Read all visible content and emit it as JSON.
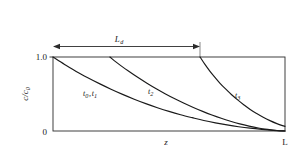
{
  "figure": {
    "caption_present": false,
    "background_color": "#ffffff",
    "line_color": "#1a1a1a"
  },
  "chart_data": {
    "type": "line",
    "title": "",
    "subtitle": "",
    "xlabel": "z",
    "ylabel": "c/c0",
    "ylabel_display": "c/c",
    "ylabel_sub": "0",
    "xlim": [
      0,
      1
    ],
    "ylim": [
      0,
      1
    ],
    "grid": false,
    "legend_position": "inline-annotations",
    "x_tick_labels": [
      "0",
      "L"
    ],
    "x_tick_values": [
      0,
      1
    ],
    "y_tick_labels": [
      "1.0"
    ],
    "y_tick_values": [
      1.0
    ],
    "axis_origin_label": "0",
    "annotations": [
      {
        "name": "depletion-length-arrow",
        "label": "L",
        "label_sub": "d",
        "type": "double-headed-arrow",
        "x_start": 0.0,
        "x_end": 0.634
      }
    ],
    "series": [
      {
        "name": "t0-t1",
        "label": "t",
        "label_sub": "0",
        "label_full": "t0 , t1",
        "label_parts": [
          "t",
          "0",
          ",",
          "t",
          "1"
        ],
        "front_position": 0.0,
        "x": [
          0.0,
          0.05,
          0.1,
          0.15,
          0.2,
          0.25,
          0.3,
          0.35,
          0.4,
          0.45,
          0.5,
          0.55,
          0.6,
          0.65,
          0.7,
          0.75,
          0.8,
          0.85,
          0.9,
          0.95,
          1.0
        ],
        "y": [
          1.0,
          0.9,
          0.805,
          0.72,
          0.64,
          0.565,
          0.495,
          0.43,
          0.37,
          0.315,
          0.265,
          0.22,
          0.18,
          0.142,
          0.11,
          0.082,
          0.058,
          0.038,
          0.022,
          0.009,
          0.0
        ]
      },
      {
        "name": "t2",
        "label": "t",
        "label_sub": "2",
        "label_full": "t2",
        "front_position": 0.245,
        "x": [
          0.245,
          0.285,
          0.325,
          0.365,
          0.405,
          0.445,
          0.485,
          0.525,
          0.565,
          0.605,
          0.645,
          0.685,
          0.725,
          0.765,
          0.805,
          0.845,
          0.885,
          0.925,
          0.965,
          1.0
        ],
        "y": [
          1.0,
          0.9,
          0.81,
          0.725,
          0.645,
          0.57,
          0.5,
          0.435,
          0.375,
          0.318,
          0.265,
          0.216,
          0.172,
          0.132,
          0.096,
          0.066,
          0.041,
          0.022,
          0.007,
          0.0
        ]
      },
      {
        "name": "t3",
        "label": "t",
        "label_sub": "3",
        "label_full": "t3",
        "front_position": 0.634,
        "x": [
          0.634,
          0.655,
          0.676,
          0.698,
          0.72,
          0.745,
          0.77,
          0.796,
          0.822,
          0.85,
          0.878,
          0.906,
          0.935,
          0.965,
          1.0
        ],
        "y": [
          1.0,
          0.9,
          0.81,
          0.725,
          0.645,
          0.565,
          0.49,
          0.42,
          0.355,
          0.29,
          0.235,
          0.185,
          0.14,
          0.1,
          0.062
        ]
      }
    ]
  }
}
